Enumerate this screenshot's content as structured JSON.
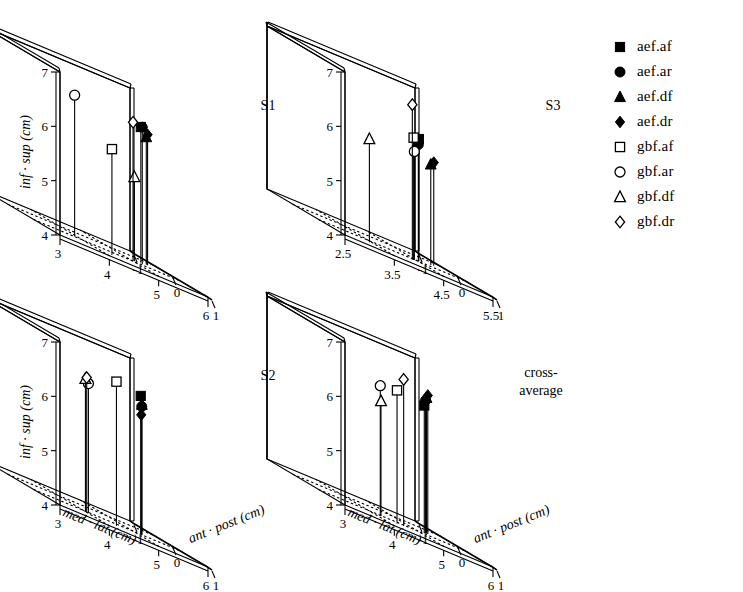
{
  "figure": {
    "title_present": false,
    "panel_count": 4
  },
  "legend": {
    "position": "right",
    "entries": [
      {
        "label": "aef.af",
        "marker": "square",
        "fill": "filled",
        "icon": "filled-square-icon"
      },
      {
        "label": "aef.ar",
        "marker": "circle",
        "fill": "filled",
        "icon": "filled-circle-icon"
      },
      {
        "label": "aef.df",
        "marker": "triangle",
        "fill": "filled",
        "icon": "filled-triangle-icon"
      },
      {
        "label": "aef.dr",
        "marker": "diamond",
        "fill": "filled",
        "icon": "filled-diamond-icon"
      },
      {
        "label": "gbf.af",
        "marker": "square",
        "fill": "open",
        "icon": "open-square-icon"
      },
      {
        "label": "gbf.ar",
        "marker": "circle",
        "fill": "open",
        "icon": "open-circle-icon"
      },
      {
        "label": "gbf.df",
        "marker": "triangle",
        "fill": "open",
        "icon": "open-triangle-icon"
      },
      {
        "label": "gbf.dr",
        "marker": "diamond",
        "fill": "open",
        "icon": "open-diamond-icon"
      }
    ]
  },
  "axes": {
    "x_label": "med · lat (cm)",
    "y_label": "ant · post (cm)",
    "z_label": "inf · sup (cm)",
    "z_ticks": [
      "7",
      "6",
      "5",
      "4"
    ],
    "z_values": [
      7,
      6,
      5,
      4
    ],
    "y_ticks": [
      "1",
      "0",
      "-1"
    ],
    "y_values": [
      1,
      0,
      -1
    ],
    "x_ticks_default": [
      "3",
      "4",
      "5",
      "6"
    ],
    "x_values_default": [
      3,
      4,
      5,
      6
    ],
    "x_ticks_s3": [
      "2.5",
      "3.5",
      "4.5",
      "5.5"
    ],
    "x_values_s3": [
      2.5,
      3.5,
      4.5,
      5.5
    ]
  },
  "chart_data": {
    "type": "scatter",
    "title": "",
    "xlabel": "med · lat (cm)",
    "ylabel": "ant · post (cm)",
    "zlabel": "inf · sup (cm)",
    "projection": "3d-stem",
    "grid": "floor-dotted",
    "legend_position": "right",
    "xlim_default": [
      3,
      6
    ],
    "xlim_s3": [
      2.5,
      5.5
    ],
    "ylim": [
      1,
      -1
    ],
    "zlim": [
      4,
      7
    ],
    "series_names": [
      "aef.af",
      "aef.ar",
      "aef.df",
      "aef.dr",
      "gbf.af",
      "gbf.ar",
      "gbf.df",
      "gbf.dr"
    ],
    "panels": [
      {
        "id": "S1",
        "label": "S1",
        "xlim": [
          3,
          6
        ],
        "points": [
          {
            "name": "aef.af",
            "x": 5.35,
            "y": 0.1,
            "z": 6.5
          },
          {
            "name": "aef.ar",
            "x": 5.3,
            "y": 0.2,
            "z": 6.52
          },
          {
            "name": "aef.df",
            "x": 5.5,
            "y": 0.05,
            "z": 6.35
          },
          {
            "name": "aef.dr",
            "x": 5.55,
            "y": 0.02,
            "z": 6.4
          },
          {
            "name": "gbf.af",
            "x": 4.25,
            "y": 0.75,
            "z": 5.95
          },
          {
            "name": "gbf.ar",
            "x": 3.85,
            "y": 0.3,
            "z": 6.6
          },
          {
            "name": "gbf.df",
            "x": 5.1,
            "y": 0.25,
            "z": 5.55
          },
          {
            "name": "gbf.dr",
            "x": 5.05,
            "y": 0.28,
            "z": 6.55
          }
        ]
      },
      {
        "id": "S3",
        "label": "S3",
        "xlim": [
          2.5,
          5.5
        ],
        "points": [
          {
            "name": "aef.af",
            "x": 4.55,
            "y": 0.3,
            "z": 6.25
          },
          {
            "name": "aef.ar",
            "x": 4.5,
            "y": 0.35,
            "z": 6.15
          },
          {
            "name": "aef.df",
            "x": 4.95,
            "y": 0.1,
            "z": 5.85
          },
          {
            "name": "aef.dr",
            "x": 5.05,
            "y": 0.05,
            "z": 5.9
          },
          {
            "name": "gbf.af",
            "x": 4.35,
            "y": 0.42,
            "z": 6.25
          },
          {
            "name": "gbf.ar",
            "x": 4.38,
            "y": 0.4,
            "z": 6.0
          },
          {
            "name": "gbf.df",
            "x": 3.35,
            "y": 0.55,
            "z": 5.9
          },
          {
            "name": "gbf.dr",
            "x": 4.3,
            "y": 0.45,
            "z": 6.85
          }
        ]
      },
      {
        "id": "S2",
        "label": "S2",
        "xlim": [
          3,
          6
        ],
        "points": [
          {
            "name": "aef.af",
            "x": 5.15,
            "y": 0.35,
            "z": 6.55
          },
          {
            "name": "aef.ar",
            "x": 5.25,
            "y": 0.25,
            "z": 6.35
          },
          {
            "name": "aef.df",
            "x": 5.15,
            "y": 0.38,
            "z": 6.4
          },
          {
            "name": "aef.dr",
            "x": 5.2,
            "y": 0.3,
            "z": 6.2
          },
          {
            "name": "gbf.af",
            "x": 4.5,
            "y": 0.55,
            "z": 6.65
          },
          {
            "name": "gbf.ar",
            "x": 4.05,
            "y": 0.4,
            "z": 6.38
          },
          {
            "name": "gbf.df",
            "x": 3.95,
            "y": 0.45,
            "z": 6.45
          },
          {
            "name": "gbf.dr",
            "x": 4.0,
            "y": 0.42,
            "z": 6.48
          }
        ]
      },
      {
        "id": "cross-average",
        "label": "cross-average",
        "xlim": [
          3,
          6
        ],
        "points": [
          {
            "name": "aef.af",
            "x": 5.2,
            "y": 0.25,
            "z": 6.35
          },
          {
            "name": "aef.ar",
            "x": 5.25,
            "y": 0.22,
            "z": 6.45
          },
          {
            "name": "aef.df",
            "x": 5.3,
            "y": 0.18,
            "z": 6.5
          },
          {
            "name": "aef.dr",
            "x": 5.35,
            "y": 0.15,
            "z": 6.55
          },
          {
            "name": "gbf.af",
            "x": 4.45,
            "y": 0.5,
            "z": 6.45
          },
          {
            "name": "gbf.ar",
            "x": 4.15,
            "y": 0.45,
            "z": 6.4
          },
          {
            "name": "gbf.df",
            "x": 4.18,
            "y": 0.43,
            "z": 6.12
          },
          {
            "name": "gbf.dr",
            "x": 4.6,
            "y": 0.48,
            "z": 6.7
          }
        ]
      }
    ]
  }
}
